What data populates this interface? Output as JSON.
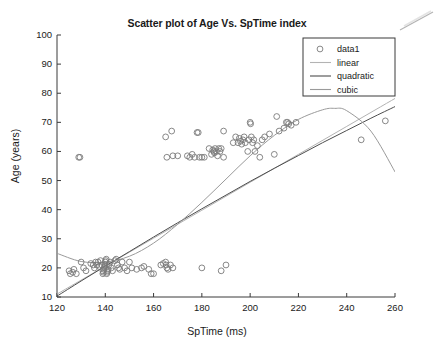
{
  "figure": {
    "title": "Scatter plot of Age Vs. SpTime index",
    "background_color": "#ffffff",
    "axes_color": "#3a3a3a"
  },
  "chart_data": {
    "type": "scatter",
    "title": "Scatter plot of Age Vs. SpTime index",
    "xlabel": "SpTime (ms)",
    "ylabel": "Age (years)",
    "xlim": [
      120,
      260
    ],
    "ylim": [
      10,
      100
    ],
    "xticks": [
      120,
      140,
      160,
      180,
      200,
      220,
      240,
      260
    ],
    "yticks": [
      10,
      20,
      30,
      40,
      50,
      60,
      70,
      80,
      90,
      100
    ],
    "grid": false,
    "legend_position": "top-right",
    "legend": [
      {
        "label": "data1",
        "type": "marker",
        "marker": "circle-open",
        "color": "#7a7a7a"
      },
      {
        "label": "linear",
        "type": "line",
        "color": "#b3b3b3"
      },
      {
        "label": "quadratic",
        "type": "line",
        "color": "#4d4d4d"
      },
      {
        "label": "cubic",
        "type": "line",
        "color": "#9a9a9a"
      }
    ],
    "series": [
      {
        "name": "data1",
        "type": "scatter",
        "marker": "circle-open",
        "color": "#7a7a7a",
        "points": [
          [
            125,
            19
          ],
          [
            125.5,
            18
          ],
          [
            126.5,
            18.5
          ],
          [
            127,
            19.5
          ],
          [
            128,
            18
          ],
          [
            129,
            58
          ],
          [
            129.5,
            58
          ],
          [
            130,
            22
          ],
          [
            131,
            20
          ],
          [
            132,
            19
          ],
          [
            134,
            21.5
          ],
          [
            135,
            21
          ],
          [
            135.5,
            20
          ],
          [
            136,
            22
          ],
          [
            136.5,
            21
          ],
          [
            137,
            22
          ],
          [
            137.5,
            20.5
          ],
          [
            138,
            22.5
          ],
          [
            138.5,
            21
          ],
          [
            139,
            19
          ],
          [
            139,
            18
          ],
          [
            139.2,
            18.5
          ],
          [
            139.4,
            19.5
          ],
          [
            139.6,
            20
          ],
          [
            139.8,
            20.5
          ],
          [
            140,
            21
          ],
          [
            140,
            22
          ],
          [
            140.2,
            22.5
          ],
          [
            140.4,
            23
          ],
          [
            140.6,
            18
          ],
          [
            140.8,
            18.5
          ],
          [
            141,
            19
          ],
          [
            141.2,
            19.5
          ],
          [
            141.5,
            21
          ],
          [
            142,
            22
          ],
          [
            142.5,
            20
          ],
          [
            143,
            19
          ],
          [
            144,
            22.5
          ],
          [
            144.5,
            23
          ],
          [
            145,
            21
          ],
          [
            145.5,
            20
          ],
          [
            146,
            19.5
          ],
          [
            147,
            22
          ],
          [
            148,
            20
          ],
          [
            149,
            19
          ],
          [
            150,
            22
          ],
          [
            151,
            20
          ],
          [
            153,
            19.5
          ],
          [
            155,
            20
          ],
          [
            156,
            20.5
          ],
          [
            158,
            19.5
          ],
          [
            159,
            18
          ],
          [
            160,
            18
          ],
          [
            163,
            21
          ],
          [
            164,
            21.5
          ],
          [
            165,
            22
          ],
          [
            165.2,
            21
          ],
          [
            165.5,
            20
          ],
          [
            166,
            19.5
          ],
          [
            167,
            21
          ],
          [
            168,
            20
          ],
          [
            165,
            65
          ],
          [
            165.5,
            58
          ],
          [
            167.5,
            67
          ],
          [
            168,
            58.5
          ],
          [
            170,
            58.5
          ],
          [
            174,
            58.5
          ],
          [
            175,
            58
          ],
          [
            176,
            59
          ],
          [
            177,
            58
          ],
          [
            178,
            66.5
          ],
          [
            178.5,
            66.5
          ],
          [
            179,
            58
          ],
          [
            180,
            20
          ],
          [
            180,
            58
          ],
          [
            181,
            58
          ],
          [
            183,
            61
          ],
          [
            184,
            59
          ],
          [
            184.5,
            60.5
          ],
          [
            185,
            60
          ],
          [
            185.2,
            59.5
          ],
          [
            185.5,
            61
          ],
          [
            186,
            60
          ],
          [
            186.5,
            58.5
          ],
          [
            187,
            61
          ],
          [
            187.5,
            60
          ],
          [
            188,
            19
          ],
          [
            188,
            61
          ],
          [
            189,
            67
          ],
          [
            189,
            58
          ],
          [
            190,
            21
          ],
          [
            193,
            63
          ],
          [
            194,
            65
          ],
          [
            195,
            63
          ],
          [
            195.5,
            64.5
          ],
          [
            196,
            63.5
          ],
          [
            196.5,
            62.5
          ],
          [
            197,
            64
          ],
          [
            197.5,
            65
          ],
          [
            198,
            63
          ],
          [
            199,
            60
          ],
          [
            199.5,
            64
          ],
          [
            200,
            70
          ],
          [
            200.2,
            69.5
          ],
          [
            200.5,
            65
          ],
          [
            201,
            63
          ],
          [
            201.5,
            64
          ],
          [
            202,
            60
          ],
          [
            203,
            62
          ],
          [
            204,
            58
          ],
          [
            205,
            64
          ],
          [
            206,
            65
          ],
          [
            208,
            66
          ],
          [
            210,
            59
          ],
          [
            211,
            72
          ],
          [
            212,
            67
          ],
          [
            214,
            68
          ],
          [
            215,
            70
          ],
          [
            215.5,
            70
          ],
          [
            216,
            69.5
          ],
          [
            217,
            69
          ],
          [
            219,
            70
          ],
          [
            246,
            64
          ],
          [
            256,
            70.5
          ]
        ]
      },
      {
        "name": "linear",
        "type": "line",
        "color": "#b3b3b3",
        "description": "Least-squares straight line fit",
        "x": [
          120,
          140,
          160,
          180,
          200,
          220,
          240,
          260
        ],
        "y": [
          11.0,
          20.6,
          30.2,
          39.8,
          49.4,
          59.0,
          68.6,
          78.2
        ]
      },
      {
        "name": "quadratic",
        "type": "line",
        "color": "#4d4d4d",
        "description": "Second order polynomial fit",
        "x": [
          120,
          130,
          140,
          150,
          160,
          170,
          180,
          190,
          200,
          210,
          220,
          230,
          240,
          250,
          260
        ],
        "y": [
          10.3,
          15.5,
          20.6,
          25.6,
          30.6,
          35.5,
          40.3,
          45.0,
          49.7,
          54.2,
          58.6,
          63.0,
          67.2,
          71.4,
          75.4
        ]
      },
      {
        "name": "cubic",
        "type": "line",
        "color": "#9a9a9a",
        "description": "Third order polynomial fit, peaks near x=235 then declines",
        "x": [
          120,
          130,
          140,
          150,
          160,
          170,
          180,
          190,
          200,
          210,
          220,
          230,
          235,
          240,
          250,
          260
        ],
        "y": [
          25.0,
          22.2,
          22.0,
          24.0,
          28.5,
          35.0,
          42.5,
          50.5,
          58.5,
          65.5,
          71.0,
          74.3,
          74.8,
          74.0,
          67.0,
          53.0
        ]
      }
    ],
    "annotations": [
      {
        "name": "scan-artifact",
        "description": "faint diagonal scan line in top-right corner"
      }
    ]
  }
}
